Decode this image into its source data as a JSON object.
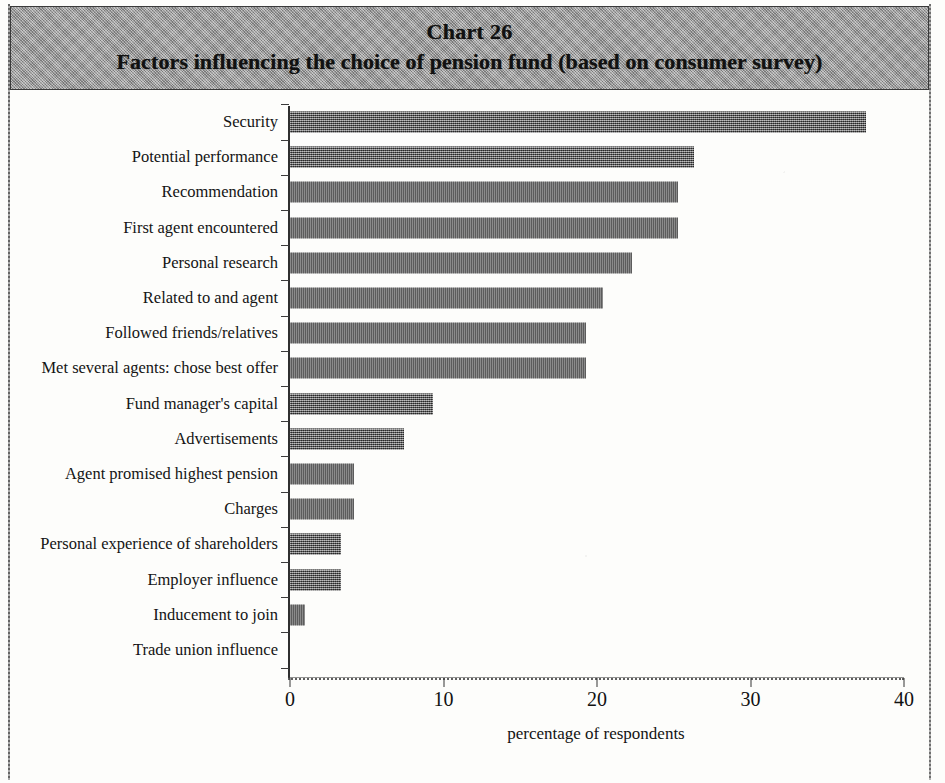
{
  "header": {
    "chart_number": "Chart 26",
    "title": "Factors influencing the choice of pension fund (based on consumer survey)"
  },
  "chart_data": {
    "type": "bar",
    "orientation": "horizontal",
    "title": "Factors influencing the choice of pension fund (based on consumer survey)",
    "chart_number": "Chart 26",
    "xlabel": "percentage of respondents",
    "ylabel": "",
    "xlim": [
      0,
      40
    ],
    "xticks": [
      0,
      10,
      20,
      30,
      40
    ],
    "xtick_labels": [
      "0",
      "10",
      "20",
      "30",
      "40"
    ],
    "grid": false,
    "legend": null,
    "bar_color": "#5d5d5d",
    "categories": [
      "Security",
      "Potential performance",
      "Recommendation",
      "First agent encountered",
      "Personal research",
      "Related to and agent",
      "Followed friends/relatives",
      "Met several agents: chose best offer",
      "Fund manager's capital",
      "Advertisements",
      "Agent promised highest pension",
      "Charges",
      "Personal experience of shareholders",
      "Employer influence",
      "Inducement to join",
      "Trade union influence"
    ],
    "values": [
      37.5,
      26.3,
      25.3,
      25.3,
      22.3,
      20.4,
      19.3,
      19.3,
      9.3,
      7.4,
      4.2,
      4.2,
      3.3,
      3.3,
      1.0,
      0
    ]
  }
}
